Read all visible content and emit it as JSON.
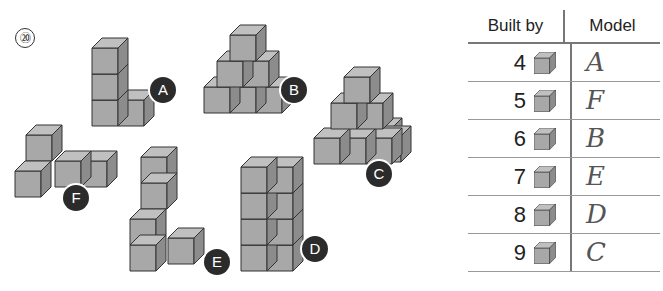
{
  "question_number": "⑳",
  "figures": [
    {
      "label": "A",
      "cubes": 4
    },
    {
      "label": "B",
      "cubes": 6
    },
    {
      "label": "C",
      "cubes": 9
    },
    {
      "label": "D",
      "cubes": 8
    },
    {
      "label": "E",
      "cubes": 7
    },
    {
      "label": "F",
      "cubes": 5
    }
  ],
  "table": {
    "headers": [
      "Built by",
      "Model"
    ],
    "rows": [
      {
        "count": "4",
        "icon": "cube-icon",
        "answer": "A"
      },
      {
        "count": "5",
        "icon": "cube-icon",
        "answer": "F"
      },
      {
        "count": "6",
        "icon": "cube-icon",
        "answer": "B"
      },
      {
        "count": "7",
        "icon": "cube-icon",
        "answer": "E"
      },
      {
        "count": "8",
        "icon": "cube-icon",
        "answer": "D"
      },
      {
        "count": "9",
        "icon": "cube-icon",
        "answer": "C"
      }
    ]
  },
  "colors": {
    "cube_front": "#a8a8a8",
    "cube_top": "#c0c0c0",
    "cube_side": "#8c8c8c",
    "label_bg": "#2b2b2b"
  }
}
